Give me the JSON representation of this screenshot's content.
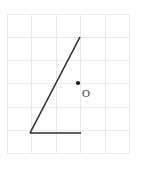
{
  "figure": {
    "canvas": {
      "width": 153,
      "height": 170,
      "background": "#ffffff"
    },
    "grid": {
      "color": "#e9e9ec",
      "line_width": 1,
      "columns": 6,
      "rows": 6,
      "x_start": 7,
      "y_start": 14,
      "cell_width": 24.5,
      "cell_height": 23.3,
      "x_positions": [
        7,
        31.5,
        56,
        80.5,
        105,
        129.5
      ],
      "y_positions": [
        14,
        37.3,
        60.6,
        83.9,
        107.2,
        130.5,
        153.8
      ]
    },
    "angle": {
      "stroke_color": "#2b2b2b",
      "stroke_width": 1.6,
      "vertex": {
        "x": 30,
        "y": 133
      },
      "rays": [
        {
          "name": "horizontal-ray",
          "from": {
            "x": 30,
            "y": 133
          },
          "to": {
            "x": 81,
            "y": 133
          }
        },
        {
          "name": "slanted-ray",
          "from": {
            "x": 30,
            "y": 133
          },
          "to": {
            "x": 80,
            "y": 37
          }
        }
      ]
    },
    "point": {
      "label": "O",
      "dot": {
        "x": 78,
        "y": 83,
        "radius": 2.1,
        "color": "#1a1a1a"
      },
      "label_position": {
        "x": 82,
        "y": 94
      },
      "label_color": "#3a3a3a"
    }
  }
}
